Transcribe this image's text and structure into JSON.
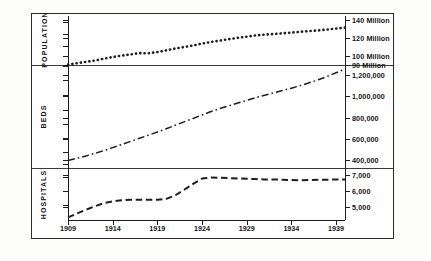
{
  "chart_data": {
    "type": "line",
    "title": "",
    "xlabel": "",
    "ylabel": "",
    "grid": false,
    "legend_position": "none",
    "x": [
      1909,
      1910,
      1911,
      1912,
      1913,
      1914,
      1915,
      1916,
      1917,
      1918,
      1919,
      1920,
      1921,
      1922,
      1923,
      1924,
      1925,
      1926,
      1927,
      1928,
      1929,
      1930,
      1931,
      1932,
      1933,
      1934,
      1935,
      1936,
      1937,
      1938,
      1939,
      1940
    ],
    "panels": [
      {
        "name": "POPULATION",
        "label": "POPULATION",
        "axis_ticks": [
          {
            "value": 140000000,
            "label": "140 Million"
          },
          {
            "value": 120000000,
            "label": "120 Million"
          },
          {
            "value": 100000000,
            "label": "100 Million"
          },
          {
            "value": 90000000,
            "label": "90 Million"
          }
        ],
        "ylim": [
          90000000,
          145000000
        ],
        "series": [
          {
            "name": "Population",
            "style": "dotted",
            "values": [
              90500000,
              92000000,
              93500000,
              95000000,
              97000000,
              99000000,
              100500000,
              101900000,
              103300000,
              103200000,
              104500000,
              106500000,
              108500000,
              110100000,
              111900000,
              114100000,
              115800000,
              117400000,
              119000000,
              120500000,
              121800000,
              123200000,
              124100000,
              124800000,
              125600000,
              126400000,
              127300000,
              128100000,
              128800000,
              129800000,
              130900000,
              132000000
            ]
          }
        ]
      },
      {
        "name": "BEDS",
        "label": "BEDS",
        "axis_ticks": [
          {
            "value": 1200000,
            "label": "1,200,000"
          },
          {
            "value": 1000000,
            "label": "1,000,000"
          },
          {
            "value": 800000,
            "label": "800,000"
          },
          {
            "value": 600000,
            "label": "600,000"
          },
          {
            "value": 400000,
            "label": "400,000"
          }
        ],
        "ylim": [
          330000,
          1290000
        ],
        "series": [
          {
            "name": "Beds",
            "style": "dash-dot",
            "values": [
              400000,
              420000,
              442000,
              466000,
              492000,
              520000,
              548000,
              578000,
              607000,
              636000,
              665000,
              696000,
              728000,
              760000,
              792000,
              824000,
              856000,
              884000,
              910000,
              936000,
              960000,
              985000,
              1008000,
              1030000,
              1052000,
              1074000,
              1098000,
              1124000,
              1152000,
              1183000,
              1218000,
              1252000
            ]
          }
        ]
      },
      {
        "name": "HOSPITALS",
        "label": "HOSPITALS",
        "axis_ticks": [
          {
            "value": 7000,
            "label": "7,000"
          },
          {
            "value": 6000,
            "label": "6,000"
          },
          {
            "value": 5000,
            "label": "5,000"
          }
        ],
        "ylim": [
          4200,
          7400
        ],
        "series": [
          {
            "name": "Hospitals",
            "style": "dashed",
            "values": [
              4360,
              4600,
              4830,
              5040,
              5230,
              5350,
              5420,
              5440,
              5450,
              5450,
              5440,
              5500,
              5720,
              6060,
              6420,
              6750,
              6810,
              6800,
              6780,
              6760,
              6740,
              6720,
              6700,
              6690,
              6680,
              6660,
              6650,
              6660,
              6670,
              6680,
              6690,
              6700
            ]
          }
        ]
      }
    ],
    "xticks": [
      {
        "value": 1909,
        "label": "1909"
      },
      {
        "value": 1914,
        "label": "1914"
      },
      {
        "value": 1919,
        "label": "1919"
      },
      {
        "value": 1924,
        "label": "1924"
      },
      {
        "value": 1929,
        "label": "1929"
      },
      {
        "value": 1934,
        "label": "1934"
      },
      {
        "value": 1939,
        "label": "1939"
      }
    ],
    "xlim": [
      1909,
      1940
    ],
    "colors": {
      "ink": "#1e1e1e",
      "background": "#fefefe"
    }
  }
}
